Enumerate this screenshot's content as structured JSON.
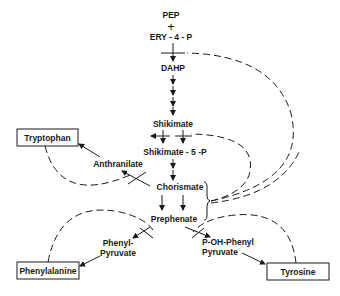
{
  "diagram": {
    "nodes": {
      "pep": "PEP",
      "plus": "+",
      "ery4p": "ERY - 4 - P",
      "dahp": "DAHP",
      "shikimate": "Shikimate",
      "shikimate5p": "Shikimate - 5 -P",
      "chorismate": "Chorismate",
      "anthranilate": "Anthranilate",
      "prephenate": "Prephenate",
      "phenylpyruvate_line1": "Phenyl-",
      "phenylpyruvate_line2": "Pyruvate",
      "pohphenylpyruvate_line1": "P-OH-Phenyl",
      "pohphenylpyruvate_line2": "Pyruvate"
    },
    "end_products": {
      "tryptophan": "Tryptophan",
      "phenylalanine": "Phenylalanine",
      "tyrosine": "Tyrosine"
    },
    "edges": [
      {
        "from": "PEP + ERY-4-P",
        "to": "DAHP",
        "type": "solid"
      },
      {
        "from": "DAHP",
        "to": "Shikimate",
        "type": "solid"
      },
      {
        "from": "Shikimate",
        "to": "Shikimate-5-P",
        "type": "solid"
      },
      {
        "from": "Shikimate-5-P",
        "to": "Chorismate",
        "type": "solid"
      },
      {
        "from": "Chorismate",
        "to": "Anthranilate",
        "type": "solid"
      },
      {
        "from": "Anthranilate",
        "to": "Tryptophan",
        "type": "solid"
      },
      {
        "from": "Chorismate",
        "to": "Prephenate",
        "type": "solid"
      },
      {
        "from": "Prephenate",
        "to": "Phenyl-Pyruvate",
        "type": "solid"
      },
      {
        "from": "Phenyl-Pyruvate",
        "to": "Phenylalanine",
        "type": "solid"
      },
      {
        "from": "Prephenate",
        "to": "P-OH-Phenyl Pyruvate",
        "type": "solid"
      },
      {
        "from": "P-OH-Phenyl Pyruvate",
        "to": "Tyrosine",
        "type": "solid"
      },
      {
        "from": "Tryptophan",
        "to": "Chorismate->Anthranilate",
        "type": "dashed-feedback"
      },
      {
        "from": "Phenylalanine",
        "to": "Prephenate->Phenyl-Pyruvate",
        "type": "dashed-feedback"
      },
      {
        "from": "Tyrosine",
        "to": "Prephenate->P-OH-Phenyl Pyruvate",
        "type": "dashed-feedback"
      },
      {
        "from": "Chorismate/Prephenate",
        "to": "DAHP synthesis",
        "type": "dashed-feedback"
      },
      {
        "from": "Chorismate/Prephenate",
        "to": "Shikimate->Shikimate-5-P",
        "type": "dashed-feedback"
      }
    ]
  }
}
